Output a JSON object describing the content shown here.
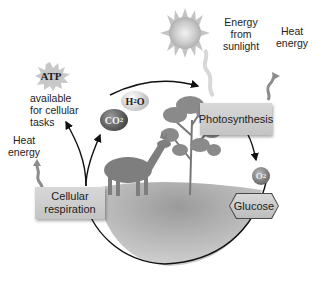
{
  "diagram": {
    "sun": {
      "icon": "sun-icon",
      "label": "Energy from sunlight"
    },
    "photosynthesis": {
      "label": "Photosynthesis",
      "heat_label": "Heat energy"
    },
    "respiration": {
      "label_line1": "Cellular",
      "label_line2": "respiration",
      "heat_label_line1": "Heat",
      "heat_label_line2": "energy"
    },
    "atp": {
      "badge": "ATP",
      "caption_line1": "available",
      "caption_line2": "for cellular",
      "caption_line3": "tasks"
    },
    "molecules": {
      "water": {
        "base": "H",
        "sub": "2",
        "tail": "O"
      },
      "co2": {
        "base": "CO",
        "sub": "2"
      },
      "o2": {
        "base": "O",
        "sub": "2"
      },
      "glucose": "Glucose"
    },
    "sunlight_lines": [
      "Energy",
      "from",
      "sunlight"
    ],
    "heat_right_lines": [
      "Heat",
      "energy"
    ]
  }
}
